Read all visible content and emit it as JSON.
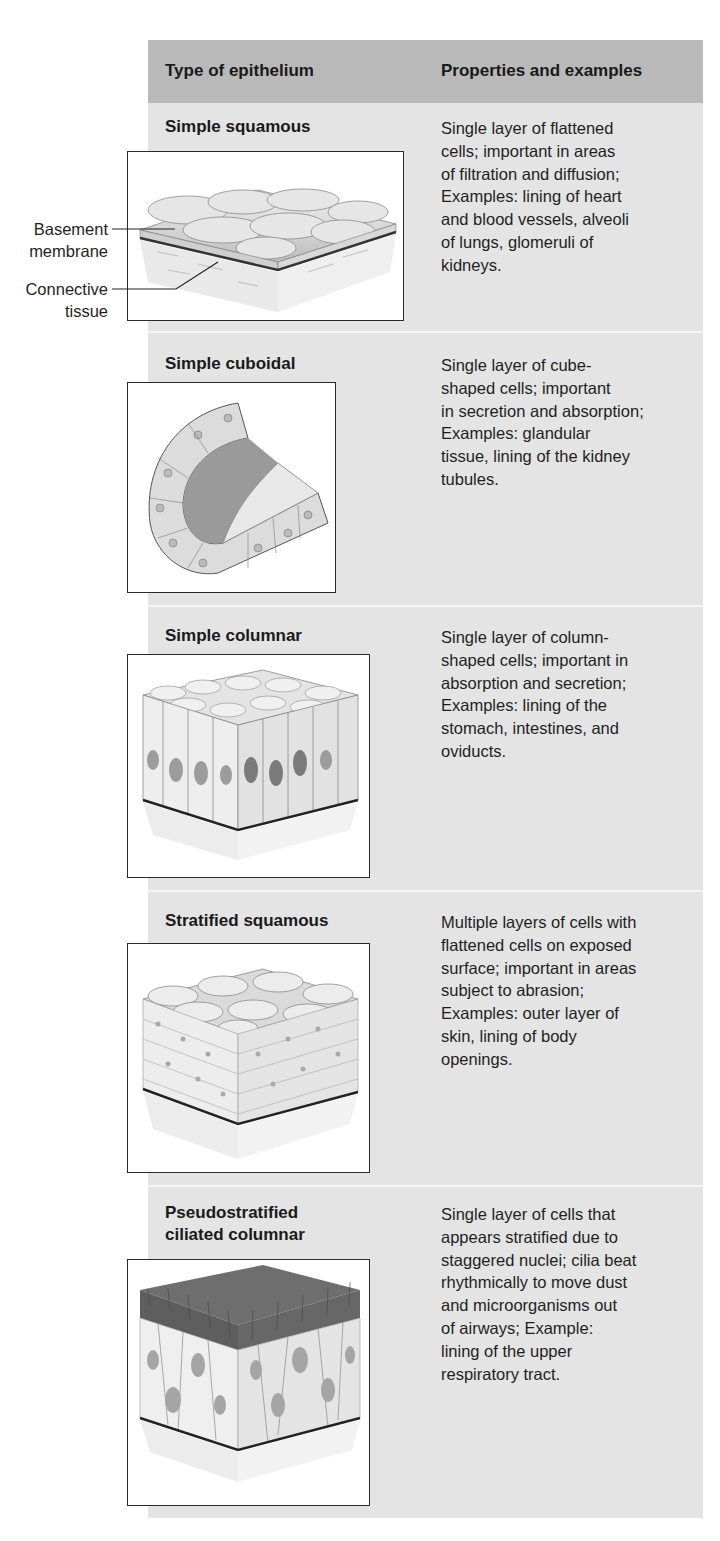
{
  "table": {
    "header": {
      "col1": "Type of epithelium",
      "col2": "Properties and examples"
    },
    "rows": [
      {
        "title_lines": [
          "Simple squamous"
        ],
        "description": [
          "Single layer of flattened",
          "cells; important in areas",
          "of filtration and diffusion;",
          "Examples: lining of heart",
          "and blood vessels, alveoli",
          "of lungs, glomeruli of",
          "kidneys."
        ],
        "figure": "simple-squamous-illustration"
      },
      {
        "title_lines": [
          "Simple cuboidal"
        ],
        "description": [
          "Single layer of cube-",
          "shaped cells; important",
          "in secretion and absorption;",
          "Examples: glandular",
          "tissue, lining of the kidney",
          "tubules."
        ],
        "figure": "simple-cuboidal-illustration"
      },
      {
        "title_lines": [
          "Simple columnar"
        ],
        "description": [
          "Single layer of column-",
          "shaped cells; important in",
          "absorption and secretion;",
          "Examples: lining of the",
          "stomach, intestines, and",
          "oviducts."
        ],
        "figure": "simple-columnar-illustration"
      },
      {
        "title_lines": [
          "Stratified squamous"
        ],
        "description": [
          "Multiple layers of cells with",
          "flattened cells on exposed",
          "surface; important in areas",
          "subject to abrasion;",
          "Examples: outer layer of",
          "skin, lining of body",
          "openings."
        ],
        "figure": "stratified-squamous-illustration"
      },
      {
        "title_lines": [
          "Pseudostratified",
          "ciliated columnar"
        ],
        "description": [
          "Single layer of cells that",
          "appears stratified due to",
          "staggered nuclei; cilia beat",
          "rhythmically to move dust",
          "and microorganisms out",
          "of airways; Example:",
          "lining of the upper",
          "respiratory tract."
        ],
        "figure": "pseudostratified-illustration"
      }
    ]
  },
  "callouts": {
    "basement_membrane": [
      "Basement",
      "membrane"
    ],
    "connective_tissue": [
      "Connective",
      "tissue"
    ]
  },
  "colors": {
    "header_bg": "#b9b9b9",
    "table_bg": "#e4e4e4",
    "divider": "#f6f6f6"
  }
}
